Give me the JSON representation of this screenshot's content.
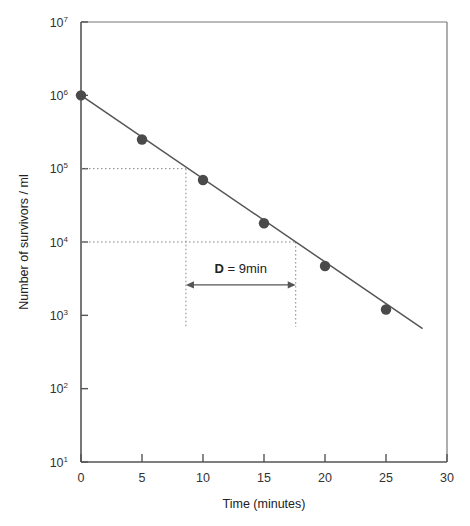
{
  "chart_data": {
    "type": "line",
    "title": "",
    "xlabel": "Time (minutes)",
    "ylabel": "Number of survivors / ml",
    "xlim": [
      0,
      30
    ],
    "ylim": [
      10,
      10000000
    ],
    "yscale": "log",
    "grid": false,
    "legend": null,
    "x": [
      0,
      5,
      10,
      15,
      20,
      25
    ],
    "values": [
      1000000,
      250000,
      70000,
      18000,
      4700,
      1200
    ],
    "series": [
      {
        "name": "survivors",
        "x": [
          0,
          5,
          10,
          15,
          20,
          25
        ],
        "values": [
          1000000,
          250000,
          70000,
          18000,
          4700,
          1200
        ],
        "marker": "filled-circle",
        "color": "#4a4a4a"
      }
    ],
    "fit_line": {
      "x_start": 0,
      "x_end": 28,
      "y_start": 1000000,
      "y_end": 660
    },
    "xticks": [
      0,
      5,
      10,
      15,
      20,
      25,
      30
    ],
    "xtick_labels": [
      "0",
      "5",
      "10",
      "15",
      "20",
      "25",
      "30"
    ],
    "yticks": [
      10,
      100,
      1000,
      10000,
      100000,
      1000000,
      10000000
    ],
    "ytick_labels": [
      {
        "base": "10",
        "exp": "1"
      },
      {
        "base": "10",
        "exp": "2"
      },
      {
        "base": "10",
        "exp": "3"
      },
      {
        "base": "10",
        "exp": "4"
      },
      {
        "base": "10",
        "exp": "5"
      },
      {
        "base": "10",
        "exp": "6"
      },
      {
        "base": "10",
        "exp": "7"
      }
    ],
    "annotations": [
      {
        "name": "d-value",
        "label_bold": "D",
        "label_rest": " = 9min",
        "arrow_x_start": 8.6,
        "arrow_x_end": 17.6,
        "arrow_y_level": 2600,
        "double_headed": true
      }
    ],
    "guide_lines": [
      {
        "type": "horizontal",
        "y": 100000,
        "x_from": 0,
        "x_to": 8.6
      },
      {
        "type": "horizontal",
        "y": 10000,
        "x_from": 0,
        "x_to": 17.6
      },
      {
        "type": "vertical",
        "x": 8.6,
        "y_from": 100000,
        "y_to": 700
      },
      {
        "type": "vertical",
        "x": 17.6,
        "y_from": 10000,
        "y_to": 700
      }
    ]
  },
  "colors": {
    "axis": "#555555",
    "line": "#555555",
    "marker": "#4a4a4a",
    "guide": "#888888",
    "text": "#222222",
    "background": "#ffffff"
  }
}
